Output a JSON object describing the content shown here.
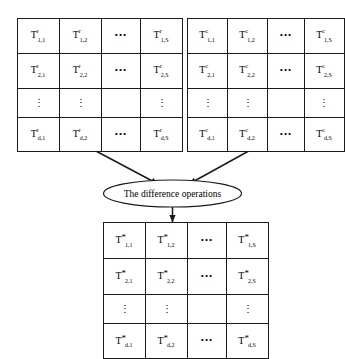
{
  "diagram": {
    "process_label": "The difference operations",
    "colors": {
      "stroke": "#1a1a1a",
      "background": "#ffffff",
      "text": "#000000"
    },
    "horizontal_ellipsis": "•••",
    "vertical_ellipsis": "⋮",
    "matrices": [
      {
        "id": "matrix-row",
        "name": "row-feature-matrix",
        "superscript": "r",
        "base": "T",
        "rows": [
          [
            {
              "type": "term",
              "base": "T",
              "sup": "r",
              "sub": "1,1"
            },
            {
              "type": "term",
              "base": "T",
              "sup": "r",
              "sub": "1,2"
            },
            {
              "type": "hdots"
            },
            {
              "type": "term",
              "base": "T",
              "sup": "r",
              "sub": "1,S"
            }
          ],
          [
            {
              "type": "term",
              "base": "T",
              "sup": "r",
              "sub": "2,1"
            },
            {
              "type": "term",
              "base": "T",
              "sup": "r",
              "sub": "2,2"
            },
            {
              "type": "hdots"
            },
            {
              "type": "term",
              "base": "T",
              "sup": "r",
              "sub": "2,S"
            }
          ],
          [
            {
              "type": "vdots"
            },
            {
              "type": "vdots"
            },
            {
              "type": "blank"
            },
            {
              "type": "vdots"
            }
          ],
          [
            {
              "type": "term",
              "base": "T",
              "sup": "r",
              "sub": "d,1"
            },
            {
              "type": "term",
              "base": "T",
              "sup": "r",
              "sub": "d,2"
            },
            {
              "type": "hdots"
            },
            {
              "type": "term",
              "base": "T",
              "sup": "r",
              "sub": "d,S"
            }
          ]
        ]
      },
      {
        "id": "matrix-col",
        "name": "column-feature-matrix",
        "superscript": "c",
        "base": "T",
        "rows": [
          [
            {
              "type": "term",
              "base": "T",
              "sup": "c",
              "sub": "1,1"
            },
            {
              "type": "term",
              "base": "T",
              "sup": "c",
              "sub": "1,2"
            },
            {
              "type": "hdots"
            },
            {
              "type": "term",
              "base": "T",
              "sup": "c",
              "sub": "1,S"
            }
          ],
          [
            {
              "type": "term",
              "base": "T",
              "sup": "c",
              "sub": "2,1"
            },
            {
              "type": "term",
              "base": "T",
              "sup": "c",
              "sub": "2,2"
            },
            {
              "type": "hdots"
            },
            {
              "type": "term",
              "base": "T",
              "sup": "c",
              "sub": "2,S"
            }
          ],
          [
            {
              "type": "vdots"
            },
            {
              "type": "vdots"
            },
            {
              "type": "blank"
            },
            {
              "type": "vdots"
            }
          ],
          [
            {
              "type": "term",
              "base": "T",
              "sup": "c",
              "sub": "d,1"
            },
            {
              "type": "term",
              "base": "T",
              "sup": "c",
              "sub": "d,2"
            },
            {
              "type": "hdots"
            },
            {
              "type": "term",
              "base": "T",
              "sup": "c",
              "sub": "d,S"
            }
          ]
        ]
      },
      {
        "id": "matrix-diff",
        "name": "difference-result-matrix",
        "superscript": "*",
        "base": "T",
        "rows": [
          [
            {
              "type": "term",
              "base": "T",
              "sup": "*",
              "sub": "1,1"
            },
            {
              "type": "term",
              "base": "T",
              "sup": "*",
              "sub": "1,2"
            },
            {
              "type": "hdots"
            },
            {
              "type": "term",
              "base": "T",
              "sup": "*",
              "sub": "1,S"
            }
          ],
          [
            {
              "type": "term",
              "base": "T",
              "sup": "*",
              "sub": "2,1"
            },
            {
              "type": "term",
              "base": "T",
              "sup": "*",
              "sub": "2,2"
            },
            {
              "type": "hdots"
            },
            {
              "type": "term",
              "base": "T",
              "sup": "*",
              "sub": "2,S"
            }
          ],
          [
            {
              "type": "vdots"
            },
            {
              "type": "vdots"
            },
            {
              "type": "blank"
            },
            {
              "type": "vdots"
            }
          ],
          [
            {
              "type": "term",
              "base": "T",
              "sup": "*",
              "sub": "d,1"
            },
            {
              "type": "term",
              "base": "T",
              "sup": "*",
              "sub": "d,2"
            },
            {
              "type": "hdots"
            },
            {
              "type": "term",
              "base": "T",
              "sup": "*",
              "sub": "d,S"
            }
          ]
        ]
      }
    ],
    "arrows": [
      {
        "name": "arrow-row-to-process",
        "from": "matrix-row",
        "to": "process"
      },
      {
        "name": "arrow-col-to-process",
        "from": "matrix-col",
        "to": "process"
      },
      {
        "name": "arrow-process-to-result",
        "from": "process",
        "to": "matrix-diff"
      }
    ]
  }
}
